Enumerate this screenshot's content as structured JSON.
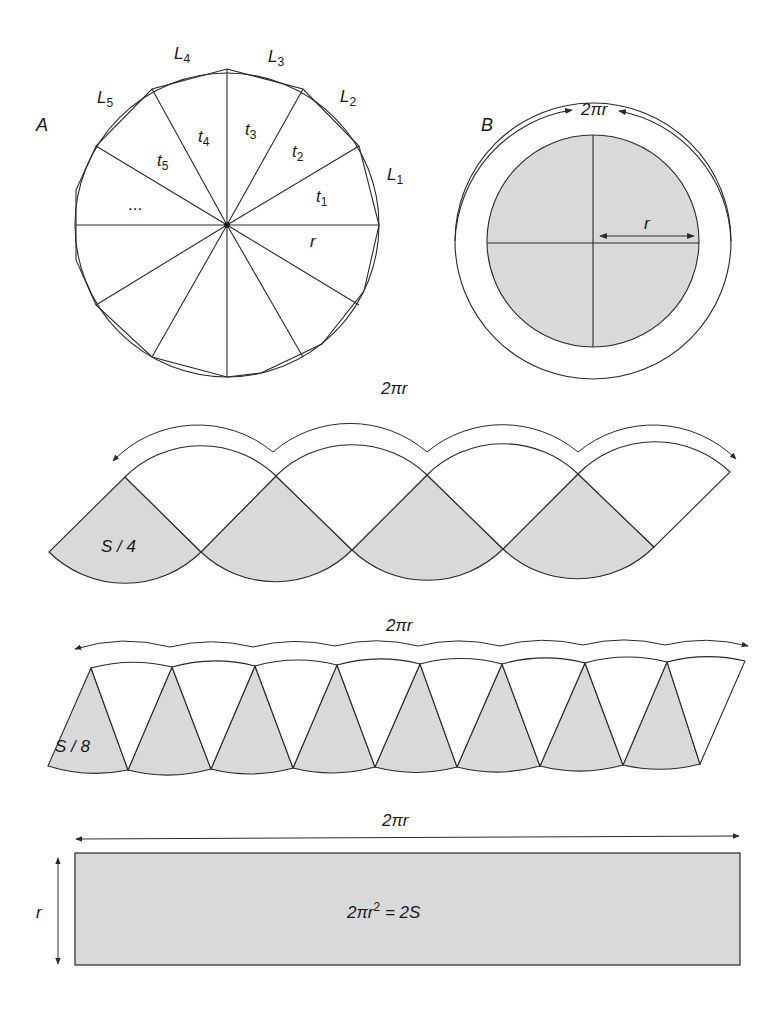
{
  "figure_A": {
    "label": "A",
    "vertex_labels": [
      {
        "base": "L",
        "sub": "1"
      },
      {
        "base": "L",
        "sub": "2"
      },
      {
        "base": "L",
        "sub": "3"
      },
      {
        "base": "L",
        "sub": "4"
      },
      {
        "base": "L",
        "sub": "5"
      }
    ],
    "triangle_labels": [
      {
        "base": "t",
        "sub": "1"
      },
      {
        "base": "t",
        "sub": "2"
      },
      {
        "base": "t",
        "sub": "3"
      },
      {
        "base": "t",
        "sub": "4"
      },
      {
        "base": "t",
        "sub": "5"
      }
    ],
    "ellipsis": "...",
    "radius_label": "r",
    "polygon_sides": 14
  },
  "figure_B": {
    "label": "B",
    "circumference_label": "2πr",
    "radius_label": "r",
    "quadrants": 4
  },
  "strip_quarters": {
    "span_label": "2πr",
    "piece_label": "S / 4",
    "pieces": 4
  },
  "strip_eighths": {
    "span_label": "2πr",
    "piece_label": "S / 8",
    "pieces": 8
  },
  "rectangle": {
    "width_label": "2πr",
    "height_label": "r",
    "area_formula_lhs": "2πr",
    "area_formula_exp": "2",
    "area_formula_rhs": " = 2S"
  },
  "colors": {
    "stroke": "#2a2a2a",
    "fill_shaded": "#d9d9d9",
    "background": "#ffffff"
  }
}
